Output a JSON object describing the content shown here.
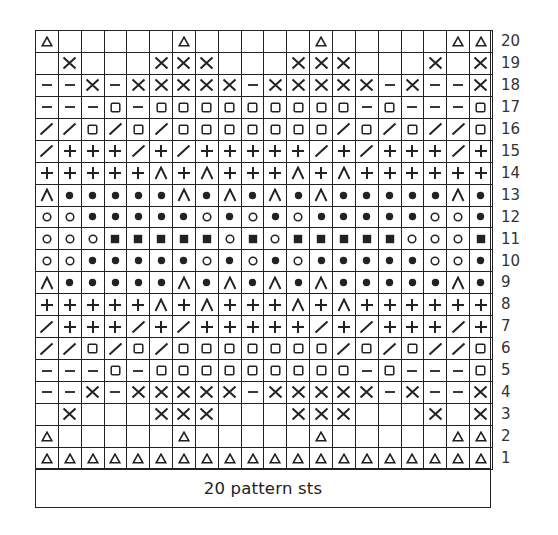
{
  "chart_data": {
    "type": "table",
    "footer": "20 pattern sts",
    "columns": 20,
    "rows_count": 20,
    "legend_symbols": {
      "tri": "triangle",
      "x": "cross",
      "dash": "dash",
      "sq": "open square",
      "sl": "slash",
      "plus": "plus",
      "cap": "caret / inverted v",
      "dot": "filled dot",
      "o": "open circle",
      "bsq": "filled square",
      "": "blank"
    },
    "rows": [
      {
        "label": "20",
        "cells": [
          "tri",
          "",
          "",
          "",
          "",
          "",
          "tri",
          "",
          "",
          "",
          "",
          "",
          "tri",
          "",
          "",
          "",
          "",
          "",
          "tri",
          "tri"
        ]
      },
      {
        "label": "19",
        "cells": [
          "",
          "x",
          "",
          "",
          "",
          "x",
          "x",
          "x",
          "",
          "",
          "",
          "x",
          "x",
          "x",
          "",
          "",
          "",
          "x",
          "",
          "x"
        ]
      },
      {
        "label": "18",
        "cells": [
          "dash",
          "dash",
          "x",
          "dash",
          "x",
          "x",
          "x",
          "x",
          "x",
          "dash",
          "x",
          "x",
          "x",
          "x",
          "x",
          "dash",
          "x",
          "dash",
          "dash",
          "x"
        ]
      },
      {
        "label": "17",
        "cells": [
          "dash",
          "dash",
          "dash",
          "sq",
          "dash",
          "sq",
          "sq",
          "sq",
          "sq",
          "sq",
          "sq",
          "sq",
          "sq",
          "sq",
          "dash",
          "sq",
          "dash",
          "dash",
          "dash",
          "sq"
        ]
      },
      {
        "label": "16",
        "cells": [
          "sl",
          "sl",
          "sq",
          "sl",
          "sq",
          "sl",
          "sq",
          "sq",
          "sq",
          "sq",
          "sq",
          "sq",
          "sq",
          "sl",
          "sq",
          "sl",
          "sq",
          "sl",
          "sl",
          "sq"
        ]
      },
      {
        "label": "15",
        "cells": [
          "sl",
          "plus",
          "plus",
          "plus",
          "sl",
          "plus",
          "sl",
          "plus",
          "plus",
          "plus",
          "plus",
          "plus",
          "sl",
          "plus",
          "sl",
          "plus",
          "plus",
          "plus",
          "sl",
          "plus"
        ]
      },
      {
        "label": "14",
        "cells": [
          "plus",
          "plus",
          "plus",
          "plus",
          "plus",
          "cap",
          "plus",
          "cap",
          "plus",
          "plus",
          "plus",
          "cap",
          "plus",
          "cap",
          "plus",
          "plus",
          "plus",
          "plus",
          "plus",
          "plus"
        ]
      },
      {
        "label": "13",
        "cells": [
          "cap",
          "dot",
          "dot",
          "dot",
          "dot",
          "dot",
          "cap",
          "dot",
          "cap",
          "dot",
          "cap",
          "dot",
          "cap",
          "dot",
          "dot",
          "dot",
          "dot",
          "dot",
          "cap",
          "dot"
        ]
      },
      {
        "label": "12",
        "cells": [
          "o",
          "o",
          "dot",
          "dot",
          "dot",
          "dot",
          "dot",
          "o",
          "dot",
          "o",
          "dot",
          "o",
          "dot",
          "dot",
          "dot",
          "dot",
          "dot",
          "o",
          "o",
          "dot"
        ]
      },
      {
        "label": "11",
        "cells": [
          "o",
          "o",
          "o",
          "bsq",
          "bsq",
          "bsq",
          "bsq",
          "bsq",
          "o",
          "bsq",
          "o",
          "bsq",
          "bsq",
          "bsq",
          "bsq",
          "bsq",
          "o",
          "o",
          "o",
          "bsq"
        ]
      },
      {
        "label": "10",
        "cells": [
          "o",
          "o",
          "dot",
          "dot",
          "dot",
          "dot",
          "dot",
          "o",
          "dot",
          "o",
          "dot",
          "o",
          "dot",
          "dot",
          "dot",
          "dot",
          "dot",
          "o",
          "o",
          "dot"
        ]
      },
      {
        "label": "9",
        "cells": [
          "cap",
          "dot",
          "dot",
          "dot",
          "dot",
          "dot",
          "cap",
          "dot",
          "cap",
          "dot",
          "cap",
          "dot",
          "cap",
          "dot",
          "dot",
          "dot",
          "dot",
          "dot",
          "cap",
          "dot"
        ]
      },
      {
        "label": "8",
        "cells": [
          "plus",
          "plus",
          "plus",
          "plus",
          "plus",
          "cap",
          "plus",
          "cap",
          "plus",
          "plus",
          "plus",
          "cap",
          "plus",
          "cap",
          "plus",
          "plus",
          "plus",
          "plus",
          "plus",
          "plus"
        ]
      },
      {
        "label": "7",
        "cells": [
          "sl",
          "plus",
          "plus",
          "plus",
          "sl",
          "plus",
          "sl",
          "plus",
          "plus",
          "plus",
          "plus",
          "plus",
          "sl",
          "plus",
          "sl",
          "plus",
          "plus",
          "plus",
          "sl",
          "plus"
        ]
      },
      {
        "label": "6",
        "cells": [
          "sl",
          "sl",
          "sq",
          "sl",
          "sq",
          "sl",
          "sq",
          "sq",
          "sq",
          "sq",
          "sq",
          "sq",
          "sq",
          "sl",
          "sq",
          "sl",
          "sq",
          "sl",
          "sl",
          "sq"
        ]
      },
      {
        "label": "5",
        "cells": [
          "dash",
          "dash",
          "dash",
          "sq",
          "dash",
          "sq",
          "sq",
          "sq",
          "sq",
          "sq",
          "sq",
          "sq",
          "sq",
          "sq",
          "dash",
          "sq",
          "dash",
          "dash",
          "dash",
          "sq"
        ]
      },
      {
        "label": "4",
        "cells": [
          "dash",
          "dash",
          "x",
          "dash",
          "x",
          "x",
          "x",
          "x",
          "x",
          "dash",
          "x",
          "x",
          "x",
          "x",
          "x",
          "dash",
          "x",
          "dash",
          "dash",
          "x"
        ]
      },
      {
        "label": "3",
        "cells": [
          "",
          "x",
          "",
          "",
          "",
          "x",
          "x",
          "x",
          "",
          "",
          "",
          "x",
          "x",
          "x",
          "",
          "",
          "",
          "x",
          "",
          "x"
        ]
      },
      {
        "label": "2",
        "cells": [
          "tri",
          "",
          "",
          "",
          "",
          "",
          "tri",
          "",
          "",
          "",
          "",
          "",
          "tri",
          "",
          "",
          "",
          "",
          "",
          "tri",
          "tri"
        ]
      },
      {
        "label": "1",
        "cells": [
          "tri",
          "tri",
          "tri",
          "tri",
          "tri",
          "tri",
          "tri",
          "tri",
          "tri",
          "tri",
          "tri",
          "tri",
          "tri",
          "tri",
          "tri",
          "tri",
          "tri",
          "tri",
          "tri",
          "tri"
        ]
      }
    ]
  },
  "footer": {
    "label": "20 pattern sts"
  },
  "colors": {
    "ink": "#222222",
    "background": "#ffffff"
  }
}
